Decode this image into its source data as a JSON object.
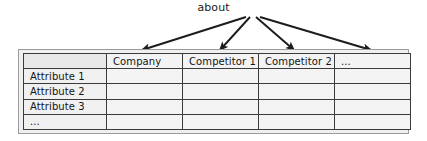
{
  "diagram": {
    "annotation_label": "about",
    "arrow_color": "#1c1c1c",
    "frame_border_color": "#9a9a9a",
    "cell_border_color": "#3b3b3b"
  },
  "table": {
    "corner_cell": "",
    "column_headers": [
      "Company",
      "Competitor 1",
      "Competitor 2",
      "..."
    ],
    "row_headers": [
      "Attribute 1",
      "Attribute 2",
      "Attribute 3",
      "..."
    ],
    "rows": [
      {
        "label": "Attribute 1",
        "cells": [
          "",
          "",
          "",
          ""
        ]
      },
      {
        "label": "Attribute 2",
        "cells": [
          "",
          "",
          "",
          ""
        ]
      },
      {
        "label": "Attribute 3",
        "cells": [
          "",
          "",
          "",
          ""
        ]
      },
      {
        "label": "...",
        "cells": [
          "",
          "",
          "",
          ""
        ]
      }
    ]
  }
}
